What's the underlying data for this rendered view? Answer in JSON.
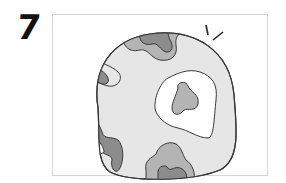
{
  "figure": {
    "number_label": "7",
    "illustration": "blob-with-contour-patches",
    "colors": {
      "outline": "#3a3a3a",
      "base_fill": "#e6e6e6",
      "light_patch": "#ffffff",
      "mid_patch": "#b4b4b4",
      "dark_patch": "#8c8c8c",
      "frame_border": "#d6d6d6"
    }
  }
}
